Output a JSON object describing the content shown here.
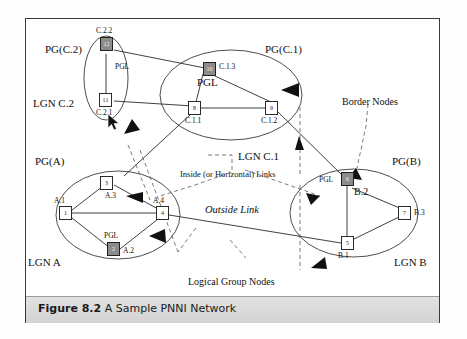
{
  "figure": {
    "number": "Figure 8.2",
    "title": "A Sample PNNI Network"
  },
  "peer_groups": [
    {
      "id": "pg-c2",
      "label": "PG(C.2)",
      "lgn_label": "LGN C.2"
    },
    {
      "id": "pg-c1",
      "label": "PG(C.1)",
      "lgn_label": "LGN C.1"
    },
    {
      "id": "pg-a",
      "label": "PG(A)",
      "lgn_label": "LGN A"
    },
    {
      "id": "pg-b",
      "label": "PG(B)",
      "lgn_label": "LGN B"
    }
  ],
  "nodes": [
    {
      "id": "1",
      "number": "1",
      "name": "A.1",
      "pgl": false,
      "group": "PG(A)"
    },
    {
      "id": "2",
      "number": "2",
      "name": "A.2",
      "pgl": true,
      "group": "PG(A)"
    },
    {
      "id": "3",
      "number": "3",
      "name": "A.3",
      "pgl": false,
      "group": "PG(A)"
    },
    {
      "id": "4",
      "number": "4",
      "name": "A.4",
      "pgl": false,
      "group": "PG(A)"
    },
    {
      "id": "5",
      "number": "5",
      "name": "B.1",
      "pgl": false,
      "group": "PG(B)"
    },
    {
      "id": "6",
      "number": "6",
      "name": "B.2",
      "pgl": true,
      "group": "PG(B)"
    },
    {
      "id": "7",
      "number": "7",
      "name": "B.3",
      "pgl": false,
      "group": "PG(B)"
    },
    {
      "id": "8",
      "number": "8",
      "name": "C.1.1",
      "pgl": false,
      "group": "PG(C.1)"
    },
    {
      "id": "9",
      "number": "9",
      "name": "C.1.2",
      "pgl": false,
      "group": "PG(C.1)"
    },
    {
      "id": "10",
      "number": "10",
      "name": "C.1.3",
      "pgl": true,
      "group": "PG(C.1)"
    },
    {
      "id": "11",
      "number": "11",
      "name": "C.2.1",
      "pgl": false,
      "group": "PG(C.2)"
    },
    {
      "id": "12",
      "number": "12",
      "name": "C.2.2",
      "pgl": true,
      "group": "PG(C.2)"
    }
  ],
  "pgl_labels": {
    "c2": "PGL",
    "c1": "PGL",
    "a": "PGL",
    "b": "PGL"
  },
  "annotations": {
    "border_nodes": "Border Nodes",
    "inside_links": "Inside (or Horizontal) Links",
    "outside_link": "Outside Link",
    "logical_group_nodes": "Logical Group Nodes"
  },
  "colors": {
    "pgl_fill": "#8c8c8c",
    "node_fill": "#ffffff",
    "line": "#2b2b2b",
    "caption_bar": "#d8d8d8",
    "frame": "#3a3a3a"
  }
}
